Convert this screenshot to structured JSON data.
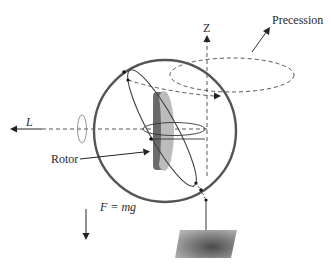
{
  "figure": {
    "labels": {
      "z_axis": "Z",
      "precession": "Precession",
      "angular_momentum": "L",
      "rotor": "Rotor",
      "force": "F = mg"
    }
  },
  "colors": {
    "outline": "#4a4a4a",
    "gimbal_ring": "#555555",
    "rotor_dark": "#6e6e6e",
    "rotor_light": "#bcbcbc",
    "base_dark": "#5a5a5a",
    "base_light": "#a8a8a8",
    "text": "#2a2a2a"
  }
}
